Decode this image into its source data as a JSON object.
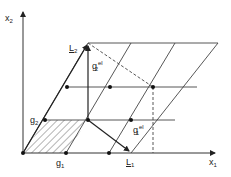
{
  "diagram": {
    "type": "lattice-diagram",
    "axes": {
      "x1": {
        "label": "x",
        "subscript": "1"
      },
      "x2": {
        "label": "x",
        "subscript": "2"
      }
    },
    "vectors": {
      "g1": {
        "label": "g",
        "subscript": "1"
      },
      "g2": {
        "label": "g",
        "subscript": "2"
      },
      "L1": {
        "label": "L",
        "subscript": "1"
      },
      "L2": {
        "label": "L",
        "subscript": "2"
      },
      "g1_el": {
        "label": "g",
        "subscript": "1",
        "superscript": "el"
      },
      "g2_el": {
        "label": "g",
        "subscript": "2",
        "superscript": "el"
      }
    },
    "hatched_cell": "unit cell spanned by g1 and g2",
    "colors": {
      "line": "#333333",
      "background": "#ffffff"
    }
  }
}
